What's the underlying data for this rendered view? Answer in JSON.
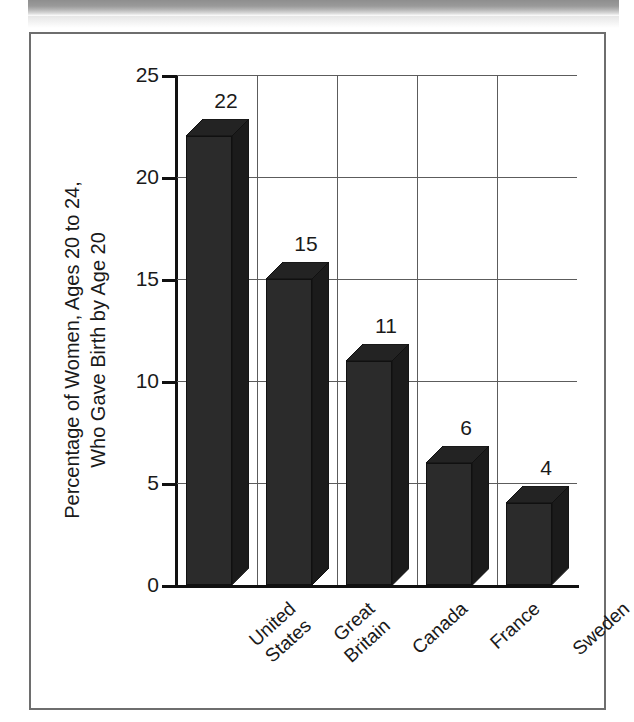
{
  "figure": {
    "frame_color": "#6e6e6e",
    "background": "#ffffff",
    "scan_shadow": "scanned-page-top-shadow"
  },
  "chart_data": {
    "type": "bar",
    "title": "",
    "subtitle": "",
    "xlabel": "",
    "ylabel": "Percentage of Women, Ages 20 to 24,\nWho Gave Birth by Age 20",
    "categories": [
      "United\nStates",
      "Great\nBritain",
      "Canada",
      "France",
      "Sweden"
    ],
    "category_names": [
      "United States",
      "Great Britain",
      "Canada",
      "France",
      "Sweden"
    ],
    "values": [
      22,
      15,
      11,
      6,
      4
    ],
    "data_labels": [
      "22",
      "15",
      "11",
      "6",
      "4"
    ],
    "ylim": [
      0,
      25
    ],
    "ytick_values": [
      0,
      5,
      10,
      15,
      20,
      25
    ],
    "ytick_labels": [
      "0",
      "5",
      "10",
      "15",
      "20",
      "25"
    ],
    "grid": "horizontal-and-vertical",
    "legend": "none",
    "legend_position": "none",
    "bar_style": "3d-block",
    "bar_color": "#2b2b2b",
    "axis_color": "#111111",
    "gridline_color": "#5c5c5c"
  }
}
